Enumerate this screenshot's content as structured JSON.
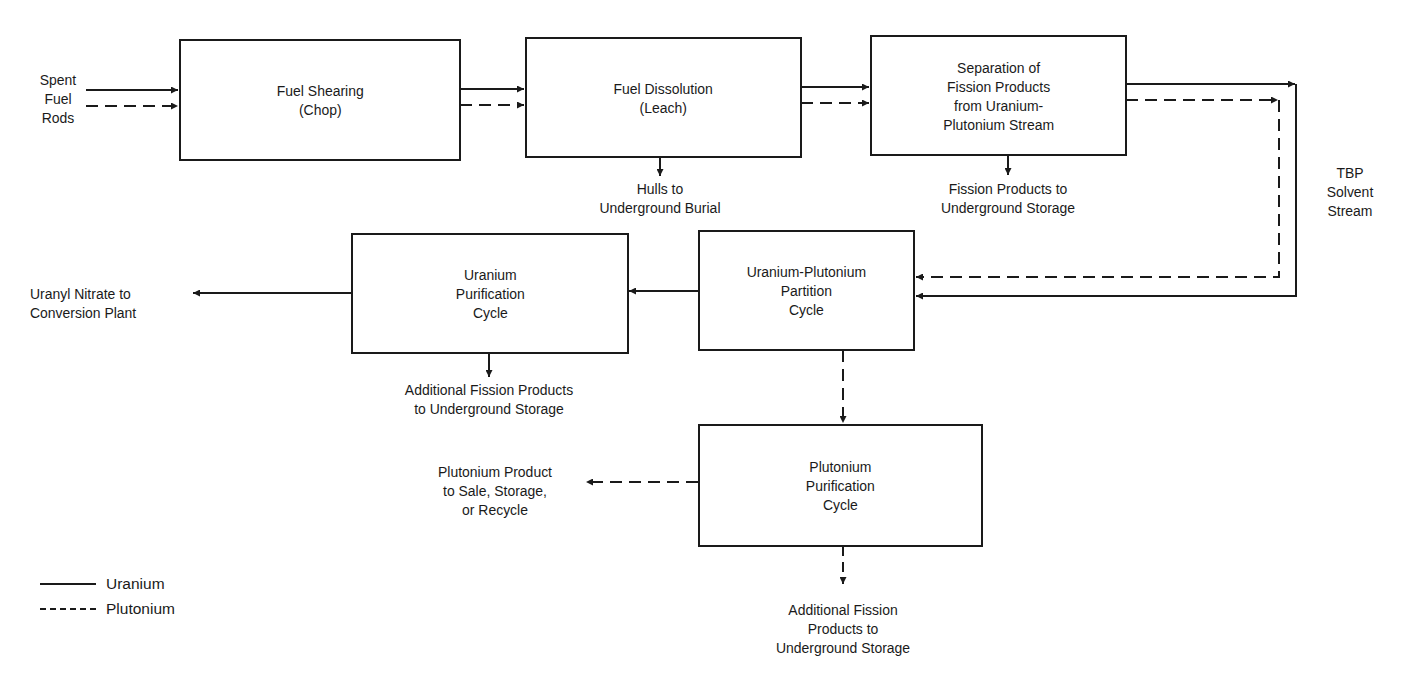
{
  "diagram": {
    "type": "process-flow",
    "inputs": {
      "spent_fuel": [
        "Spent",
        "Fuel",
        "Rods"
      ]
    },
    "boxes": {
      "fuel_shearing": [
        "Fuel Shearing",
        "(Chop)"
      ],
      "fuel_dissolution": [
        "Fuel Dissolution",
        "(Leach)"
      ],
      "separation": [
        "Separation of",
        "Fission Products",
        "from Uranium-",
        "Plutonium Stream"
      ],
      "uranium_purification": [
        "Uranium",
        "Purification",
        "Cycle"
      ],
      "partition": [
        "Uranium-Plutonium",
        "Partition",
        "Cycle"
      ],
      "plutonium_purification": [
        "Plutonium",
        "Purification",
        "Cycle"
      ]
    },
    "outputs": {
      "hulls": [
        "Hulls to",
        "Underground Burial"
      ],
      "fission_products": [
        "Fission Products to",
        "Underground Storage"
      ],
      "tbp": [
        "TBP",
        "Solvent",
        "Stream"
      ],
      "uranyl": [
        "Uranyl Nitrate to",
        "Conversion Plant"
      ],
      "additional_fp_u": [
        "Additional Fission Products",
        "to Underground Storage"
      ],
      "plutonium_product": [
        "Plutonium Product",
        "to Sale, Storage,",
        "or Recycle"
      ],
      "additional_fp_pu": [
        "Additional Fission",
        "Products to",
        "Underground Storage"
      ]
    },
    "legend": [
      {
        "label": "Uranium",
        "style": "solid"
      },
      {
        "label": "Plutonium",
        "style": "dashed"
      }
    ],
    "colors": {
      "line": "#1a1a1a",
      "background": "#ffffff"
    }
  }
}
